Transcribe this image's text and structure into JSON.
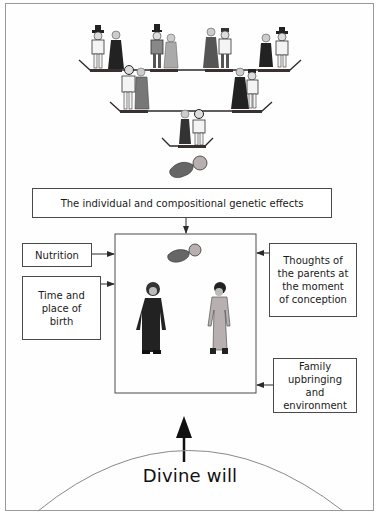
{
  "diagram": {
    "ancestry": {
      "generations": [
        {
          "level": "great-grandparents",
          "couples": 4
        },
        {
          "level": "grandparents",
          "couples": 2
        },
        {
          "level": "parents",
          "couples": 1
        }
      ],
      "offspring": "fetus"
    },
    "boxes": {
      "genetic": "The individual and compositional genetic effects",
      "nutrition": "Nutrition",
      "time_place": "Time and place of birth",
      "thoughts": "Thoughts of the parents at the moment of conception",
      "family": "Family upbringing and environment"
    },
    "center": {
      "contents": [
        "fetus",
        "male figure",
        "female figure"
      ]
    },
    "divine_will": "Divine will",
    "colors": {
      "line": "#4a4a4a",
      "frame": "#9a9a9a",
      "figure_dark": "#2a2a2a",
      "figure_light": "#b8b0b0"
    }
  }
}
